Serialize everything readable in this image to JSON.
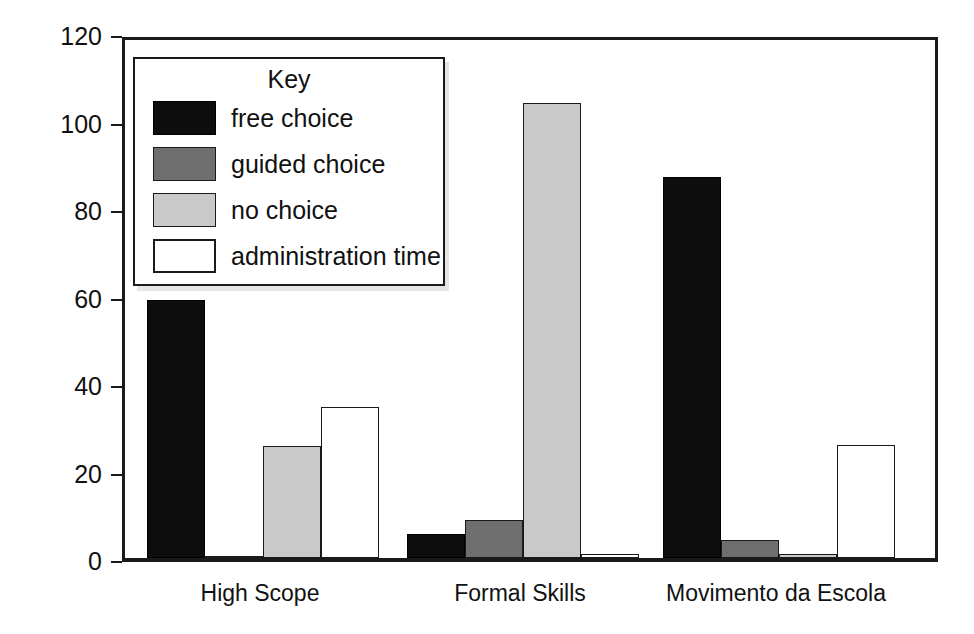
{
  "chart_data": {
    "type": "bar",
    "title": "",
    "xlabel": "",
    "ylabel": "mean counts per hour",
    "categories": [
      "High Scope",
      "Formal Skills",
      "Movimento da Escola"
    ],
    "series": [
      {
        "name": "free choice",
        "color": "#0d0d0d",
        "values": [
          59,
          5.5,
          87
        ]
      },
      {
        "name": "guided choice",
        "color": "#6e6e6e",
        "values": [
          0.5,
          8.8,
          4.2
        ]
      },
      {
        "name": "no choice",
        "color": "#c9c9c9",
        "values": [
          25.5,
          104,
          1
        ]
      },
      {
        "name": "administration time",
        "color": "#ffffff",
        "values": [
          34.5,
          1,
          25.8
        ]
      }
    ],
    "ylim": [
      0,
      120
    ],
    "yticks": [
      0,
      20,
      40,
      60,
      80,
      100,
      120
    ],
    "ytick_labels": [
      "0",
      "20",
      "40",
      "60",
      "80",
      "100",
      "120"
    ],
    "grid": false,
    "legend": {
      "title": "Key",
      "position": "upper-left-inside",
      "entries": [
        "free choice",
        "guided choice",
        "no choice",
        "administration time"
      ]
    }
  }
}
